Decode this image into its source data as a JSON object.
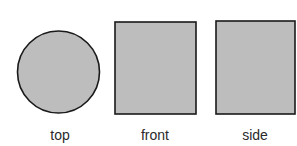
{
  "diagram": {
    "views": [
      {
        "label": "top",
        "shape": "circle"
      },
      {
        "label": "front",
        "shape": "square"
      },
      {
        "label": "side",
        "shape": "square"
      }
    ],
    "colors": {
      "fill": "#bdbdbd",
      "stroke": "#1a1a1a"
    }
  }
}
